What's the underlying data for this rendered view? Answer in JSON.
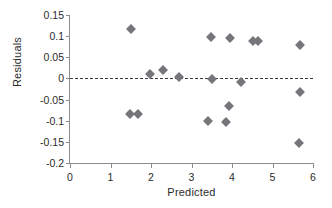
{
  "chart_data": {
    "type": "scatter",
    "title": "",
    "xlabel": "Predicted",
    "ylabel": "Residuals",
    "xlim": [
      0,
      6
    ],
    "ylim": [
      -0.2,
      0.15
    ],
    "xticks": [
      "0",
      "1",
      "2",
      "3",
      "4",
      "5",
      "6"
    ],
    "xtick_values": [
      0,
      1,
      2,
      3,
      4,
      5,
      6
    ],
    "yticks": [
      "0.15",
      "0.1",
      "0.05",
      "0",
      "-0.05",
      "-0.1",
      "-0.15",
      "-0.2"
    ],
    "ytick_values": [
      0.15,
      0.1,
      0.05,
      0,
      -0.05,
      -0.1,
      -0.15,
      -0.2
    ],
    "grid": false,
    "legend": false,
    "marker_shape": "diamond",
    "marker_color": "#75757a",
    "reference_line": {
      "orientation": "horizontal",
      "value": 0,
      "style": "dashed",
      "color": "#3a3a3a"
    },
    "series": [
      {
        "name": "Residuals",
        "points": [
          {
            "x": 1.5,
            "y": 0.117
          },
          {
            "x": 1.48,
            "y": -0.083
          },
          {
            "x": 1.68,
            "y": -0.085
          },
          {
            "x": 1.98,
            "y": 0.011
          },
          {
            "x": 2.3,
            "y": 0.02
          },
          {
            "x": 2.7,
            "y": 0.004
          },
          {
            "x": 3.48,
            "y": 0.099
          },
          {
            "x": 3.95,
            "y": 0.096
          },
          {
            "x": 4.52,
            "y": 0.089
          },
          {
            "x": 4.64,
            "y": 0.089
          },
          {
            "x": 5.68,
            "y": 0.079
          },
          {
            "x": 3.51,
            "y": -0.002
          },
          {
            "x": 4.22,
            "y": -0.008
          },
          {
            "x": 3.92,
            "y": -0.065
          },
          {
            "x": 3.41,
            "y": -0.1
          },
          {
            "x": 3.85,
            "y": -0.103
          },
          {
            "x": 5.69,
            "y": -0.032
          },
          {
            "x": 5.66,
            "y": -0.152
          }
        ]
      }
    ]
  }
}
